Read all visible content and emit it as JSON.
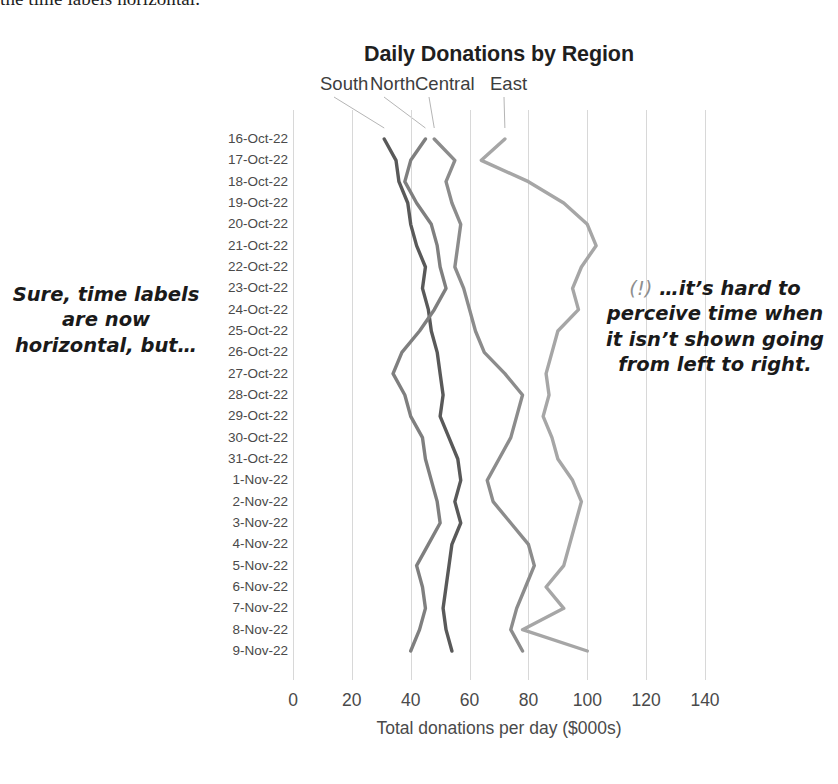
{
  "page": {
    "top_cut_text": "the time labels horizontal."
  },
  "chart": {
    "title": "Daily Donations by Region",
    "x_axis_title": "Total donations per day ($000s)"
  },
  "annotations": {
    "left": "Sure, time labels are now horizontal, but…",
    "right_marker": "(!)",
    "right": "…it’s hard to perceive time when it isn’t shown going from left to right."
  },
  "chart_data": {
    "type": "line",
    "orientation": "vertical-category-axis",
    "title": "Daily Donations by Region",
    "xlabel": "Total donations per day ($000s)",
    "ylabel": "",
    "xlim": [
      0,
      140
    ],
    "xticks": [
      0,
      20,
      40,
      60,
      80,
      100,
      120,
      140
    ],
    "grid": "vertical-only",
    "legend": "inline-series-labels-above-plot",
    "categories": [
      "16-Oct-22",
      "17-Oct-22",
      "18-Oct-22",
      "19-Oct-22",
      "20-Oct-22",
      "21-Oct-22",
      "22-Oct-22",
      "23-Oct-22",
      "24-Oct-22",
      "25-Oct-22",
      "26-Oct-22",
      "27-Oct-22",
      "28-Oct-22",
      "29-Oct-22",
      "30-Oct-22",
      "31-Oct-22",
      "1-Nov-22",
      "2-Nov-22",
      "3-Nov-22",
      "4-Nov-22",
      "5-Nov-22",
      "6-Nov-22",
      "7-Nov-22",
      "8-Nov-22",
      "9-Nov-22"
    ],
    "series": [
      {
        "name": "South",
        "color": "#595959",
        "label_x": 320,
        "values": [
          31,
          35,
          36,
          39,
          40,
          42,
          45,
          44,
          46,
          47,
          49,
          50,
          51,
          50,
          53,
          56,
          57,
          55,
          57,
          54,
          53,
          52,
          51,
          52,
          54
        ]
      },
      {
        "name": "North",
        "color": "#7f7f7f",
        "label_x": 370,
        "values": [
          45,
          40,
          38,
          42,
          47,
          49,
          50,
          52,
          48,
          43,
          37,
          34,
          38,
          40,
          44,
          45,
          47,
          49,
          50,
          46,
          42,
          44,
          45,
          43,
          40
        ]
      },
      {
        "name": "Central",
        "color": "#8c8c8c",
        "label_x": 415,
        "values": [
          48,
          55,
          52,
          54,
          57,
          56,
          55,
          58,
          60,
          62,
          65,
          72,
          78,
          76,
          74,
          70,
          66,
          68,
          74,
          80,
          82,
          79,
          76,
          74,
          78
        ]
      },
      {
        "name": "East",
        "color": "#a6a6a6",
        "label_x": 490,
        "values": [
          72,
          64,
          80,
          92,
          100,
          103,
          98,
          95,
          97,
          90,
          88,
          86,
          87,
          85,
          88,
          90,
          95,
          98,
          96,
          94,
          92,
          86,
          92,
          78,
          100
        ]
      }
    ]
  }
}
